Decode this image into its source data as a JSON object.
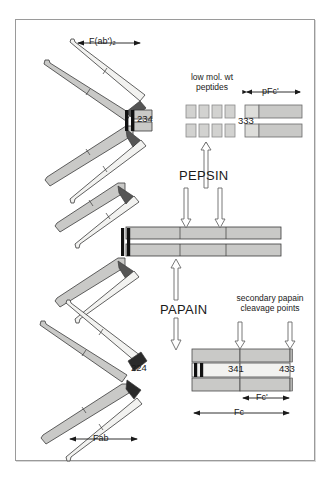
{
  "figure": {
    "background_color": "#ffffff",
    "border_color": "#9a9a9a",
    "chain_fill_light": "#f2f2f0",
    "chain_fill_gray": "#c9c9c7",
    "chain_fill_mid": "#d8d8d6",
    "outline_color": "#3a3a3a",
    "hinge_color": "#1a1a1a"
  },
  "labels": {
    "fab2": "F(ab')₂",
    "low_mol_wt_line1": "low mol. wt",
    "low_mol_wt_line2": "peptides",
    "pfc": "pFc'",
    "pepsin": "PEPSIN",
    "papain": "PAPAIN",
    "secondary_line1": "secondary papain",
    "secondary_line2": "cleavage points",
    "fab": "Fab",
    "fc": "Fc",
    "fc_prime": "Fc'"
  },
  "residue_numbers": {
    "hinge": "234",
    "fab_cleavage": "224",
    "pfc_start": "333",
    "fc_secondary_1": "341",
    "fc_secondary_2": "433"
  },
  "fragments": [
    {
      "name": "F(ab')₂",
      "description": "pepsin product, two Fab arms joined at hinge"
    },
    {
      "name": "Fab",
      "description": "papain product, single antigen binding arm"
    },
    {
      "name": "Fc",
      "description": "papain product, crystallizable fragment"
    },
    {
      "name": "Fc'",
      "description": "secondary papain cleavage product"
    },
    {
      "name": "pFc'",
      "description": "pepsin product of Fc region"
    },
    {
      "name": "low mol. wt peptides",
      "description": "pepsin digestion of Fc"
    }
  ],
  "enzymes": [
    {
      "name": "PEPSIN",
      "cleavage_site": "234",
      "products": [
        "F(ab')₂",
        "low mol. wt peptides",
        "pFc'"
      ]
    },
    {
      "name": "PAPAIN",
      "cleavage_site": "224",
      "products": [
        "Fab",
        "Fc"
      ]
    }
  ],
  "peptide_blocks": {
    "rows": 2,
    "per_row": 4
  }
}
